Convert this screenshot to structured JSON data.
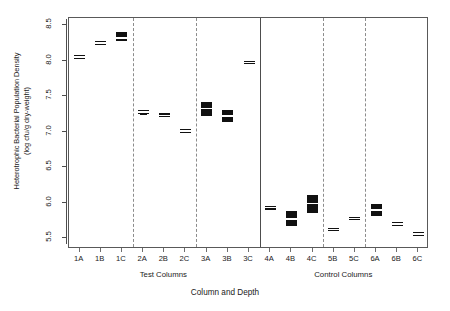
{
  "chart_data": {
    "type": "box",
    "title": "",
    "subtitle": "",
    "xlabel": "Column and Depth",
    "ylabel": "Heterotrophic Bacterial Population Density (log cfu/g dry-weight)",
    "ylabel_line1": "Heterotrophic Bacterial Population Density",
    "ylabel_line2": "(log cfu/g dry-weight)",
    "ylim": [
      5.35,
      8.6
    ],
    "yticks": [
      5.5,
      6.0,
      6.5,
      7.0,
      7.5,
      8.0,
      8.5
    ],
    "ytick_labels": [
      "5.5",
      "6.0",
      "6.5",
      "7.0",
      "7.5",
      "8.0",
      "8.5"
    ],
    "grid": false,
    "legend": "none",
    "categories": [
      "1A",
      "1B",
      "1C",
      "2A",
      "2B",
      "2C",
      "3A",
      "3B",
      "3C",
      "4A",
      "4B",
      "4C",
      "5B",
      "5C",
      "6A",
      "6B",
      "6C"
    ],
    "group_labels": [
      "Test Columns",
      "Control Columns"
    ],
    "groups": [
      {
        "name": "Test Columns",
        "categories": [
          "1A",
          "1B",
          "1C",
          "2A",
          "2B",
          "2C",
          "3A",
          "3B",
          "3C"
        ]
      },
      {
        "name": "Control Columns",
        "categories": [
          "4A",
          "4B",
          "4C",
          "5B",
          "5C",
          "6A",
          "6B",
          "6C"
        ]
      }
    ],
    "separators": {
      "solid_after": [
        "3C"
      ],
      "dashed_after": [
        "1C",
        "2C",
        "4C",
        "5C"
      ]
    },
    "boxes": [
      {
        "category": "1A",
        "q1": 8.02,
        "median": 8.05,
        "q3": 8.08,
        "lower": 8.02,
        "upper": 8.08,
        "fill": "white"
      },
      {
        "category": "1B",
        "q1": 8.23,
        "median": 8.25,
        "q3": 8.27,
        "lower": 8.23,
        "upper": 8.27,
        "fill": "white"
      },
      {
        "category": "1C",
        "q1": 8.27,
        "median": 8.32,
        "q3": 8.4,
        "lower": 8.27,
        "upper": 8.4,
        "fill": "black"
      },
      {
        "category": "2A",
        "q1": 7.27,
        "median": 7.28,
        "q3": 7.29,
        "lower": 7.25,
        "upper": 7.31,
        "fill": "white"
      },
      {
        "category": "2B",
        "q1": 7.2,
        "median": 7.23,
        "q3": 7.26,
        "lower": 7.2,
        "upper": 7.26,
        "fill": "white"
      },
      {
        "category": "2C",
        "q1": 6.98,
        "median": 7.01,
        "q3": 7.04,
        "lower": 6.98,
        "upper": 7.04,
        "fill": "white"
      },
      {
        "category": "3A",
        "q1": 7.22,
        "median": 7.33,
        "q3": 7.42,
        "lower": 7.22,
        "upper": 7.42,
        "fill": "black"
      },
      {
        "category": "3B",
        "q1": 7.14,
        "median": 7.22,
        "q3": 7.31,
        "lower": 7.14,
        "upper": 7.31,
        "fill": "black"
      },
      {
        "category": "3C",
        "q1": 7.95,
        "median": 7.97,
        "q3": 7.99,
        "lower": 7.95,
        "upper": 7.99,
        "fill": "white"
      },
      {
        "category": "4A",
        "q1": 5.9,
        "median": 5.93,
        "q3": 5.96,
        "lower": 5.9,
        "upper": 5.96,
        "fill": "white"
      },
      {
        "category": "4B",
        "q1": 5.68,
        "median": 5.77,
        "q3": 5.88,
        "lower": 5.68,
        "upper": 5.88,
        "fill": "black"
      },
      {
        "category": "4C",
        "q1": 5.85,
        "median": 5.99,
        "q3": 6.11,
        "lower": 5.85,
        "upper": 6.11,
        "fill": "black"
      },
      {
        "category": "5B",
        "q1": 5.6,
        "median": 5.62,
        "q3": 5.64,
        "lower": 5.6,
        "upper": 5.64,
        "fill": "white"
      },
      {
        "category": "5C",
        "q1": 5.76,
        "median": 5.78,
        "q3": 5.8,
        "lower": 5.76,
        "upper": 5.8,
        "fill": "white"
      },
      {
        "category": "6A",
        "q1": 5.81,
        "median": 5.9,
        "q3": 5.99,
        "lower": 5.81,
        "upper": 5.99,
        "fill": "black"
      },
      {
        "category": "6B",
        "q1": 5.68,
        "median": 5.7,
        "q3": 5.73,
        "lower": 5.68,
        "upper": 5.73,
        "fill": "white"
      },
      {
        "category": "6C",
        "q1": 5.54,
        "median": 5.56,
        "q3": 5.59,
        "lower": 5.54,
        "upper": 5.59,
        "fill": "black"
      }
    ]
  },
  "axes": {
    "xlabel": "Column and Depth",
    "ylabel_line1": "Heterotrophic Bacterial Population Density",
    "ylabel_line2": "(log cfu/g dry-weight)",
    "group_test": "Test Columns",
    "group_control": "Control Columns"
  },
  "colors": {
    "box_fill_dark": "#111111",
    "box_fill_light": "#ffffff",
    "frame": "#595959",
    "separator_dashed": "#8c8c8c",
    "separator_solid": "#4d4d4d",
    "text": "#1a1a1a",
    "background": "#ffffff"
  }
}
